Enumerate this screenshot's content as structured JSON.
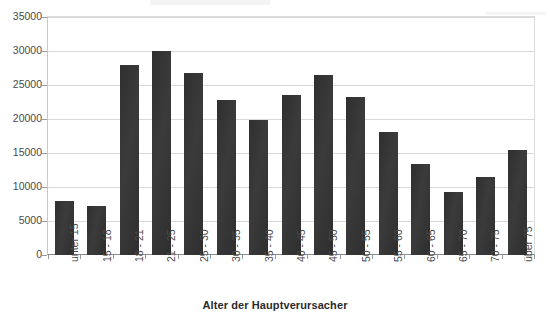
{
  "chart_data": {
    "type": "bar",
    "title": "",
    "xlabel": "Alter der Hauptverursacher",
    "ylabel": "",
    "categories": [
      "unter 15",
      "15 - 18",
      "18 - 21",
      "21 - 25",
      "25 - 30",
      "30 - 35",
      "35 - 40",
      "40 - 45",
      "45 - 50",
      "50 - 55",
      "55 - 60",
      "60 - 65",
      "65 - 70",
      "70 - 75",
      "über 75"
    ],
    "values": [
      8000,
      7200,
      27900,
      30000,
      26800,
      22800,
      19800,
      23500,
      26400,
      23200,
      18100,
      13400,
      9300,
      11400,
      15500
    ],
    "ylim": [
      0,
      35000
    ],
    "yticks": [
      0,
      5000,
      10000,
      15000,
      20000,
      25000,
      30000,
      35000
    ],
    "ytick_labels": [
      "0",
      "5000",
      "10000",
      "15000",
      "20000",
      "25000",
      "30000",
      "35000"
    ],
    "grid": true,
    "legend": false,
    "bar_color": "#333333",
    "grid_color": "#d9d9d9",
    "axis_color": "#8a8a8a",
    "background": "#ffffff"
  }
}
